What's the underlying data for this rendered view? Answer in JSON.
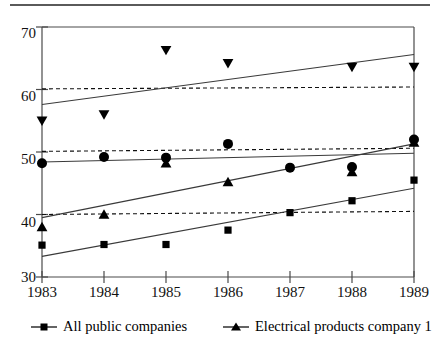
{
  "chart_data": {
    "type": "scatter",
    "title": "",
    "subtitle": "",
    "xlabel": "",
    "ylabel": "",
    "x": [
      "1983",
      "1984",
      "1985",
      "1986",
      "1987",
      "1988",
      "1989"
    ],
    "xlim": [
      1983,
      1989
    ],
    "ylim": [
      30,
      70
    ],
    "yticks": [
      "30",
      "40",
      "50",
      "60",
      "70"
    ],
    "xticks": [
      "1983",
      "1984",
      "1985",
      "1986",
      "1987",
      "1988",
      "1989"
    ],
    "grid": false,
    "legend_position": "bottom",
    "series": [
      {
        "name": "down-triangle-series",
        "marker": "triangle-down",
        "values": [
          55.0,
          56.0,
          66.3,
          64.2,
          null,
          63.6,
          63.6
        ],
        "trend_start": 57.6,
        "trend_end": 65.6
      },
      {
        "name": "circle-series",
        "marker": "circle",
        "values": [
          48.2,
          49.2,
          49.1,
          51.3,
          47.5,
          47.6,
          52.0
        ],
        "trend_start": 48.4,
        "trend_end": 49.8
      },
      {
        "name": "Electrical products company 1",
        "marker": "triangle-up",
        "values": [
          38.0,
          40.0,
          48.2,
          45.2,
          null,
          46.8,
          51.5
        ],
        "trend_start": 39.5,
        "trend_end": 51.3
      },
      {
        "name": "All public companies",
        "marker": "square",
        "values": [
          35.1,
          35.2,
          35.2,
          37.5,
          40.3,
          42.2,
          45.5
        ],
        "trend_start": 33.3,
        "trend_end": 44.2
      }
    ],
    "reference_lines": [
      {
        "name": "dashed-60",
        "start": 60.1,
        "end": 60.4,
        "style": "dashed"
      },
      {
        "name": "dashed-50",
        "start": 50.1,
        "end": 50.6,
        "style": "dashed"
      },
      {
        "name": "dashed-40",
        "start": 40.0,
        "end": 40.5,
        "style": "dashed"
      }
    ]
  },
  "axis": {
    "y_tick_labels": [
      "70",
      "60",
      "50",
      "40",
      "30"
    ],
    "x_tick_labels": [
      "1983",
      "1984",
      "1985",
      "1986",
      "1987",
      "1988",
      "1989"
    ]
  },
  "legend": {
    "items": [
      {
        "label": "All public companies",
        "marker": "square"
      },
      {
        "label": "Electrical products company 1",
        "marker": "triangle-up"
      }
    ]
  },
  "colors": {
    "ink": "#000000",
    "axis": "#4a4a4a",
    "rule": "#5a5a5a",
    "line": "#3a3a3a"
  }
}
